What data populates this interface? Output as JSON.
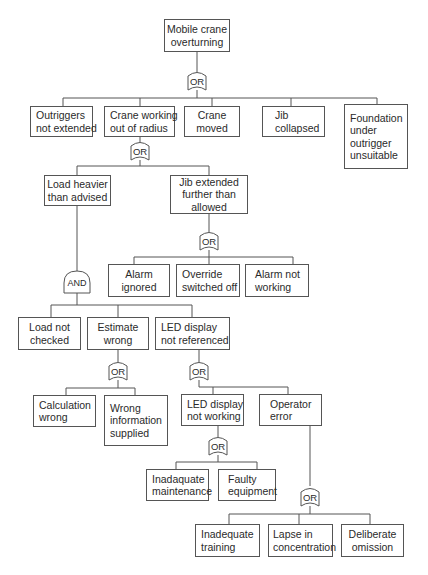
{
  "diagram": {
    "type": "fault-tree",
    "top_event": {
      "id": "top",
      "lines": [
        "Mobile crane",
        "overturning"
      ]
    },
    "gates": [
      {
        "id": "g1",
        "type": "OR",
        "label": "OR"
      },
      {
        "id": "g2",
        "type": "OR",
        "label": "OR"
      },
      {
        "id": "g3",
        "type": "OR",
        "label": "OR"
      },
      {
        "id": "g4",
        "type": "AND",
        "label": "AND"
      },
      {
        "id": "g5",
        "type": "OR",
        "label": "OR"
      },
      {
        "id": "g6",
        "type": "OR",
        "label": "OR"
      },
      {
        "id": "g7",
        "type": "OR",
        "label": "OR"
      },
      {
        "id": "g8",
        "type": "OR",
        "label": "OR"
      }
    ],
    "events": {
      "outriggers": [
        "Outriggers",
        "not extended"
      ],
      "out_of_radius": [
        "Crane working",
        "out of radius"
      ],
      "crane_moved": [
        "Crane",
        "moved"
      ],
      "jib_collapsed": [
        "Jib",
        "collapsed"
      ],
      "foundation": [
        "Foundation",
        "under",
        "outrigger",
        "unsuitable"
      ],
      "load_heavier": [
        "Load heavier",
        "than advised"
      ],
      "jib_extended": [
        "Jib extended",
        "further than",
        "allowed"
      ],
      "alarm_ignored": [
        "Alarm",
        "ignored"
      ],
      "override": [
        "Override",
        "switched off"
      ],
      "alarm_not_working": [
        "Alarm not",
        "working"
      ],
      "load_not_checked": [
        "Load not",
        "checked"
      ],
      "estimate_wrong": [
        "Estimate",
        "wrong"
      ],
      "led_not_referenced": [
        "LED display",
        "not referenced"
      ],
      "calc_wrong": [
        "Calculation",
        "wrong"
      ],
      "wrong_info": [
        "Wrong",
        "information",
        "supplied"
      ],
      "led_not_working": [
        "LED display",
        "not working"
      ],
      "operator_error": [
        "Operator",
        "error"
      ],
      "inadequate_maint": [
        "Inadaquate",
        "maintenance"
      ],
      "faulty_equipment": [
        "Faulty",
        "equipment"
      ],
      "inadequate_training": [
        "Inadequate",
        "training"
      ],
      "lapse": [
        "Lapse in",
        "concentration"
      ],
      "deliberate": [
        "Deliberate",
        "omission"
      ]
    }
  }
}
